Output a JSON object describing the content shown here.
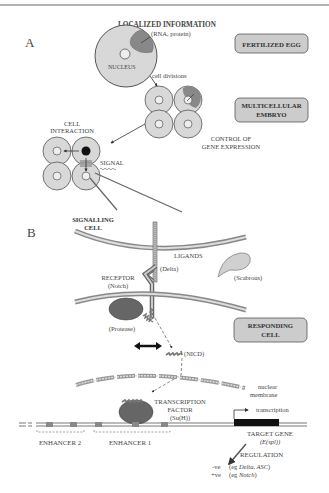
{
  "panels": {
    "a": {
      "letter": "A",
      "localized_info_title": "LOCALIZED INFORMATION",
      "localized_info_sub": "(RNA, protein)",
      "nucleus_label": "NUCLEUS",
      "cell_divisions": "cell divisions",
      "stage_fertilized_egg": "FERTILIZED EGG",
      "stage_multicellular_1": "MULTICELLULAR",
      "stage_multicellular_2": "EMBRYO",
      "control_1": "CONTROL OF",
      "control_2": "GENE EXPRESSION",
      "cell_interaction_1": "CELL",
      "cell_interaction_2": "INTERACTION",
      "signal": "SIGNAL"
    },
    "b": {
      "letter": "B",
      "signalling_cell_1": "SIGNALLING",
      "signalling_cell_2": "CELL",
      "ligands": "LIGANDS",
      "delta": "(Delta)",
      "scabrous": "(Scabrous)",
      "receptor_1": "RECEPTOR",
      "receptor_2": "(Notch)",
      "protease": "(Protease)",
      "responding_cell_1": "RESPONDING",
      "responding_cell_2": "CELL",
      "nicd": "(NICD)",
      "nuclear_membrane_1": "nuclear",
      "nuclear_membrane_2": "membrane",
      "tf_1": "TRANSCRIPTION",
      "tf_2": "FACTOR",
      "tf_3": "(Su(H))",
      "transcription": "transcription",
      "target_gene_1": "TARGET GENE",
      "target_gene_2": "(E(spl))",
      "enhancer_2": "ENHANCER 2",
      "enhancer_1": "ENHANCER 1",
      "regulation": "REGULATION",
      "neg_prefix": "-ve",
      "neg_eg": "(eg ",
      "neg_genes": "Delta, ASC",
      "neg_close": ")",
      "pos_prefix": "+ve",
      "pos_eg": "(eg ",
      "pos_genes": "Notch",
      "pos_close": ")"
    }
  },
  "colors": {
    "cell_fill": "#d8d8d8",
    "localized_fill": "#888888",
    "stage_box_fill": "#cccccc",
    "protein_fill": "#777777",
    "membrane": "#999999",
    "gene_bar": "#111111"
  }
}
